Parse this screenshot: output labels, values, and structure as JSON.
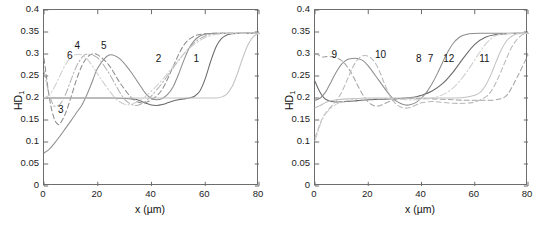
{
  "figure": {
    "background": "#ffffff",
    "axis_color": "#6d6d6d",
    "text_color": "#141414"
  },
  "chart_data": [
    {
      "panel": "left",
      "type": "line",
      "title": "",
      "xlabel": "x (µm)",
      "ylabel": "HD₁",
      "ylabel_base": "HD",
      "ylabel_sub": "1",
      "xlim": [
        0,
        80
      ],
      "ylim": [
        0,
        0.4
      ],
      "grid": false,
      "legend": "inline-curve-numbers",
      "xticks": [
        0,
        20,
        40,
        60,
        80
      ],
      "xticklabels": [
        "0",
        "20",
        "40",
        "60",
        "80"
      ],
      "yticks": [
        0,
        0.05,
        0.1,
        0.15,
        0.2,
        0.25,
        0.3,
        0.35,
        0.4
      ],
      "yticklabels": [
        "0",
        "0.05",
        "0.1",
        "0.15",
        "0.2",
        "0.25",
        "0.3",
        "0.35",
        "0.4"
      ],
      "annotations": [
        {
          "text": "1",
          "x": 57.0,
          "y": 0.286
        },
        {
          "text": "2",
          "x": 43.0,
          "y": 0.286
        },
        {
          "text": "3",
          "x": 6.6,
          "y": 0.171
        },
        {
          "text": "4",
          "x": 12.8,
          "y": 0.316
        },
        {
          "text": "5",
          "x": 22.6,
          "y": 0.317
        },
        {
          "text": "6",
          "x": 10.0,
          "y": 0.293
        }
      ],
      "series": [
        {
          "name": "1",
          "style": "solid",
          "color": "#6a6a6a",
          "x": [
            0,
            2,
            4,
            6,
            8,
            10,
            14,
            18,
            22,
            26,
            30,
            34,
            36,
            38,
            40,
            42,
            44,
            46,
            48,
            50,
            52,
            54,
            56,
            58,
            60,
            62,
            64,
            66,
            68,
            70,
            74,
            78,
            80
          ],
          "y": [
            0.2,
            0.2,
            0.2,
            0.2,
            0.2,
            0.2,
            0.2,
            0.2,
            0.2,
            0.2,
            0.199,
            0.197,
            0.193,
            0.188,
            0.184,
            0.183,
            0.185,
            0.189,
            0.193,
            0.196,
            0.198,
            0.2,
            0.204,
            0.216,
            0.244,
            0.283,
            0.316,
            0.335,
            0.343,
            0.346,
            0.347,
            0.347,
            0.347
          ]
        },
        {
          "name": "2",
          "style": "solid",
          "color": "#8d8d8d",
          "x": [
            0,
            2,
            4,
            6,
            8,
            10,
            12,
            14,
            16,
            18,
            20,
            24,
            28,
            32,
            36,
            38,
            40,
            42,
            44,
            46,
            48,
            50,
            52,
            54,
            56,
            58,
            60,
            64,
            68,
            72,
            76,
            80
          ],
          "y": [
            0.075,
            0.084,
            0.098,
            0.114,
            0.131,
            0.148,
            0.166,
            0.183,
            0.208,
            0.238,
            0.268,
            0.297,
            0.29,
            0.262,
            0.226,
            0.209,
            0.199,
            0.196,
            0.199,
            0.208,
            0.225,
            0.253,
            0.285,
            0.313,
            0.331,
            0.341,
            0.345,
            0.347,
            0.347,
            0.347,
            0.347,
            0.347
          ]
        },
        {
          "name": "3",
          "style": "dashed",
          "color": "#8d8d8d",
          "x": [
            0,
            1,
            2,
            3,
            4,
            5,
            6,
            8,
            10,
            12,
            14,
            16,
            18,
            20,
            24,
            28,
            32,
            34,
            36,
            38,
            40,
            42,
            44,
            46,
            48,
            52,
            56,
            60,
            64,
            68,
            72,
            76,
            80
          ],
          "y": [
            0.29,
            0.244,
            0.2,
            0.17,
            0.15,
            0.141,
            0.142,
            0.165,
            0.201,
            0.24,
            0.272,
            0.292,
            0.3,
            0.298,
            0.276,
            0.237,
            0.204,
            0.194,
            0.189,
            0.19,
            0.196,
            0.205,
            0.22,
            0.243,
            0.271,
            0.32,
            0.341,
            0.346,
            0.347,
            0.347,
            0.347,
            0.347,
            0.347
          ]
        },
        {
          "name": "4",
          "style": "dashdot",
          "color": "#b2b2b2",
          "x": [
            0,
            1,
            2,
            3,
            4,
            6,
            8,
            10,
            12,
            14,
            16,
            20,
            24,
            28,
            30,
            32,
            34,
            36,
            38,
            40,
            44,
            48,
            52,
            56,
            60,
            64,
            68,
            72,
            76,
            80
          ],
          "y": [
            0.262,
            0.232,
            0.207,
            0.19,
            0.181,
            0.186,
            0.208,
            0.24,
            0.271,
            0.291,
            0.3,
            0.291,
            0.258,
            0.215,
            0.197,
            0.187,
            0.183,
            0.186,
            0.194,
            0.205,
            0.234,
            0.268,
            0.3,
            0.326,
            0.341,
            0.346,
            0.347,
            0.347,
            0.347,
            0.347
          ]
        },
        {
          "name": "5",
          "style": "solid",
          "color": "#c2c2c2",
          "x": [
            0,
            4,
            8,
            12,
            16,
            20,
            24,
            28,
            32,
            36,
            40,
            44,
            48,
            52,
            56,
            60,
            64,
            66,
            68,
            70,
            72,
            74,
            76,
            78,
            80
          ],
          "y": [
            0.2,
            0.2,
            0.2,
            0.2,
            0.2,
            0.2,
            0.2,
            0.2,
            0.2,
            0.2,
            0.2,
            0.2,
            0.2,
            0.2,
            0.2,
            0.2,
            0.2,
            0.202,
            0.209,
            0.226,
            0.256,
            0.292,
            0.322,
            0.34,
            0.347
          ]
        },
        {
          "name": "6",
          "style": "dashdot",
          "color": "#cfcfcf",
          "x": [
            0,
            2,
            4,
            6,
            8,
            10,
            12,
            14,
            16,
            18,
            22,
            26,
            28,
            30,
            32,
            34,
            36,
            38,
            42,
            46,
            50,
            54,
            58,
            62,
            66,
            70,
            74,
            78,
            80
          ],
          "y": [
            0.2,
            0.207,
            0.226,
            0.252,
            0.276,
            0.292,
            0.299,
            0.298,
            0.289,
            0.273,
            0.236,
            0.203,
            0.192,
            0.186,
            0.185,
            0.189,
            0.196,
            0.205,
            0.228,
            0.256,
            0.286,
            0.312,
            0.331,
            0.342,
            0.346,
            0.347,
            0.347,
            0.347,
            0.347
          ]
        }
      ]
    },
    {
      "panel": "right",
      "type": "line",
      "title": "",
      "xlabel": "x (µm)",
      "ylabel": "HD₁",
      "ylabel_base": "HD",
      "ylabel_sub": "1",
      "xlim": [
        0,
        80
      ],
      "ylim": [
        0,
        0.4
      ],
      "grid": false,
      "legend": "inline-curve-numbers",
      "xticks": [
        0,
        20,
        40,
        60,
        80
      ],
      "xticklabels": [
        "0",
        "20",
        "40",
        "60",
        "80"
      ],
      "yticks": [
        0,
        0.05,
        0.1,
        0.15,
        0.2,
        0.25,
        0.3,
        0.35,
        0.4
      ],
      "yticklabels": [
        "0",
        "0.05",
        "0.1",
        "0.15",
        "0.2",
        "0.25",
        "0.3",
        "0.35",
        "0.4"
      ],
      "annotations": [
        {
          "text": "7",
          "x": 43.8,
          "y": 0.286
        },
        {
          "text": "8",
          "x": 39.4,
          "y": 0.286
        },
        {
          "text": "9",
          "x": 7.6,
          "y": 0.295
        },
        {
          "text": "10",
          "x": 25.0,
          "y": 0.295
        },
        {
          "text": "11",
          "x": 64.0,
          "y": 0.286
        },
        {
          "text": "12",
          "x": 50.6,
          "y": 0.286
        }
      ],
      "series": [
        {
          "name": "7",
          "style": "solid",
          "color": "#6a6a6a",
          "x": [
            0,
            1,
            2,
            3,
            4,
            6,
            8,
            12,
            16,
            20,
            24,
            28,
            32,
            34,
            36,
            38,
            40,
            44,
            48,
            52,
            56,
            60,
            64,
            68,
            72,
            76,
            80
          ],
          "y": [
            0.238,
            0.224,
            0.212,
            0.203,
            0.197,
            0.192,
            0.191,
            0.192,
            0.194,
            0.196,
            0.197,
            0.198,
            0.199,
            0.2,
            0.201,
            0.203,
            0.206,
            0.216,
            0.233,
            0.26,
            0.293,
            0.322,
            0.338,
            0.344,
            0.346,
            0.347,
            0.347
          ]
        },
        {
          "name": "8",
          "style": "solid",
          "color": "#8d8d8d",
          "x": [
            0,
            2,
            4,
            6,
            8,
            10,
            12,
            14,
            16,
            18,
            20,
            24,
            28,
            30,
            32,
            34,
            36,
            38,
            40,
            42,
            44,
            46,
            48,
            50,
            52,
            54,
            56,
            58,
            62,
            66,
            70,
            74,
            78,
            80
          ],
          "y": [
            0.195,
            0.2,
            0.214,
            0.236,
            0.259,
            0.277,
            0.287,
            0.29,
            0.29,
            0.285,
            0.273,
            0.24,
            0.207,
            0.195,
            0.188,
            0.184,
            0.185,
            0.19,
            0.2,
            0.214,
            0.233,
            0.256,
            0.282,
            0.306,
            0.325,
            0.337,
            0.343,
            0.346,
            0.347,
            0.347,
            0.347,
            0.347,
            0.347,
            0.347
          ]
        },
        {
          "name": "9",
          "style": "dashed",
          "color": "#a5a5a5",
          "x": [
            0,
            1,
            2,
            3,
            4,
            6,
            8,
            10,
            12,
            14,
            16,
            18,
            20,
            22,
            24,
            26,
            28,
            30,
            32,
            34,
            36,
            38,
            40,
            44,
            48,
            52,
            56,
            60,
            64,
            68,
            72,
            76,
            80
          ],
          "y": [
            0.3,
            0.299,
            0.295,
            0.293,
            0.294,
            0.294,
            0.291,
            0.285,
            0.272,
            0.253,
            0.229,
            0.207,
            0.191,
            0.183,
            0.182,
            0.187,
            0.192,
            0.196,
            0.198,
            0.199,
            0.199,
            0.199,
            0.199,
            0.198,
            0.197,
            0.196,
            0.195,
            0.195,
            0.195,
            0.196,
            0.206,
            0.248,
            0.298
          ]
        },
        {
          "name": "10",
          "style": "dashed",
          "color": "#b8b8b8",
          "x": [
            0,
            1,
            2,
            3,
            4,
            6,
            8,
            10,
            12,
            14,
            16,
            18,
            20,
            22,
            24,
            26,
            28,
            30,
            32,
            34,
            36,
            38,
            40,
            44,
            48,
            52,
            56,
            60,
            64,
            66,
            68,
            70,
            72,
            74,
            76,
            78,
            80
          ],
          "y": [
            0.11,
            0.126,
            0.143,
            0.156,
            0.166,
            0.18,
            0.194,
            0.213,
            0.24,
            0.268,
            0.287,
            0.296,
            0.295,
            0.285,
            0.264,
            0.234,
            0.207,
            0.189,
            0.18,
            0.177,
            0.179,
            0.184,
            0.189,
            0.192,
            0.19,
            0.188,
            0.188,
            0.191,
            0.202,
            0.214,
            0.235,
            0.262,
            0.291,
            0.317,
            0.334,
            0.344,
            0.347
          ]
        },
        {
          "name": "11",
          "style": "solid",
          "color": "#c2c2c2",
          "x": [
            0,
            2,
            4,
            6,
            8,
            12,
            16,
            20,
            24,
            28,
            32,
            36,
            40,
            44,
            48,
            52,
            56,
            60,
            62,
            64,
            66,
            68,
            70,
            72,
            74,
            76,
            78,
            80
          ],
          "y": [
            0.178,
            0.183,
            0.19,
            0.194,
            0.196,
            0.198,
            0.199,
            0.2,
            0.2,
            0.2,
            0.2,
            0.2,
            0.2,
            0.2,
            0.2,
            0.2,
            0.201,
            0.206,
            0.213,
            0.228,
            0.252,
            0.282,
            0.31,
            0.33,
            0.341,
            0.346,
            0.347,
            0.347
          ]
        },
        {
          "name": "12",
          "style": "dashdot",
          "color": "#cfcfcf",
          "x": [
            0,
            1,
            2,
            3,
            4,
            6,
            8,
            10,
            14,
            18,
            22,
            26,
            30,
            34,
            38,
            42,
            46,
            50,
            54,
            58,
            60,
            62,
            64,
            66,
            68,
            70,
            74,
            78,
            80
          ],
          "y": [
            0.103,
            0.121,
            0.14,
            0.155,
            0.164,
            0.177,
            0.186,
            0.191,
            0.196,
            0.198,
            0.199,
            0.199,
            0.198,
            0.196,
            0.196,
            0.198,
            0.203,
            0.214,
            0.236,
            0.268,
            0.287,
            0.305,
            0.322,
            0.334,
            0.342,
            0.345,
            0.347,
            0.347,
            0.347
          ]
        }
      ]
    }
  ]
}
